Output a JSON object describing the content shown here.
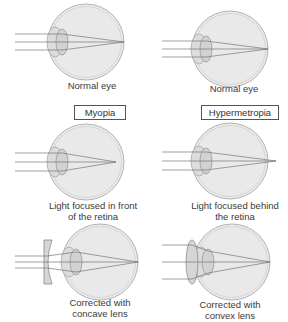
{
  "figure": {
    "columns": [
      {
        "heading": "Myopia",
        "normal_caption": "Normal eye",
        "defect_caption_line1": "Light focused in front",
        "defect_caption_line2": "of the retina",
        "corrected_caption_line1": "Corrected with",
        "corrected_caption_line2": "concave lens"
      },
      {
        "heading": "Hypermetropia",
        "normal_caption": "Normal eye",
        "defect_caption_line1": "Light focused behind",
        "defect_caption_line2": "the retina",
        "corrected_caption_line1": "Corrected with",
        "corrected_caption_line2": "convex lens"
      }
    ]
  },
  "colors": {
    "eyeball_fill": "#e8e8e8",
    "eyeball_stroke": "#b0b0b0",
    "lens_fill": "#cfcfcf",
    "ray": "#777777",
    "label_border": "#555555"
  }
}
